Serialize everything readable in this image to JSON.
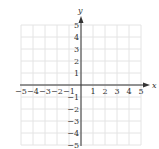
{
  "chart_data": {
    "type": "scatter",
    "title": "",
    "xlabel": "x",
    "ylabel": "y",
    "xlim": [
      -5,
      5
    ],
    "ylim": [
      -5,
      5
    ],
    "grid": true,
    "x_ticks": [
      -5,
      -4,
      -3,
      -2,
      -1,
      1,
      2,
      3,
      4,
      5
    ],
    "y_ticks": [
      5,
      4,
      3,
      2,
      1,
      -1,
      -2,
      -3,
      -4,
      -5
    ],
    "x_tick_labels": [
      "−5",
      "−4",
      "−3",
      "−2",
      "−1",
      "1",
      "2",
      "3",
      "4",
      "5"
    ],
    "y_tick_labels": [
      "5",
      "4",
      "3",
      "2",
      "1",
      "−1",
      "−2",
      "−3",
      "−4",
      "−5"
    ],
    "series": [],
    "colors": {
      "axis": "#333333",
      "grid": "#e4e4e4",
      "text": "#333333"
    }
  }
}
